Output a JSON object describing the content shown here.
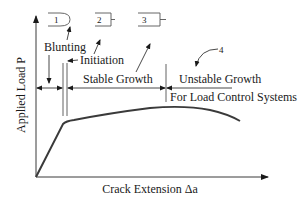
{
  "diagram": {
    "axes": {
      "x_label": "Crack Extension Δa",
      "y_label": "Applied Load P"
    },
    "stages": [
      {
        "id": "blunting",
        "label": "Blunting",
        "icon_number": "1"
      },
      {
        "id": "initiation",
        "label": "Initiation",
        "icon_number": "2"
      },
      {
        "id": "stable-growth",
        "label": "Stable Growth",
        "icon_number": "3"
      },
      {
        "id": "unstable-growth",
        "label": "Unstable Growth",
        "icon_number": "4"
      }
    ],
    "note": "For Load Control Systems",
    "colors": {
      "line": "#3a3a3a",
      "text": "#1a1a1a",
      "background": "#ffffff"
    }
  }
}
